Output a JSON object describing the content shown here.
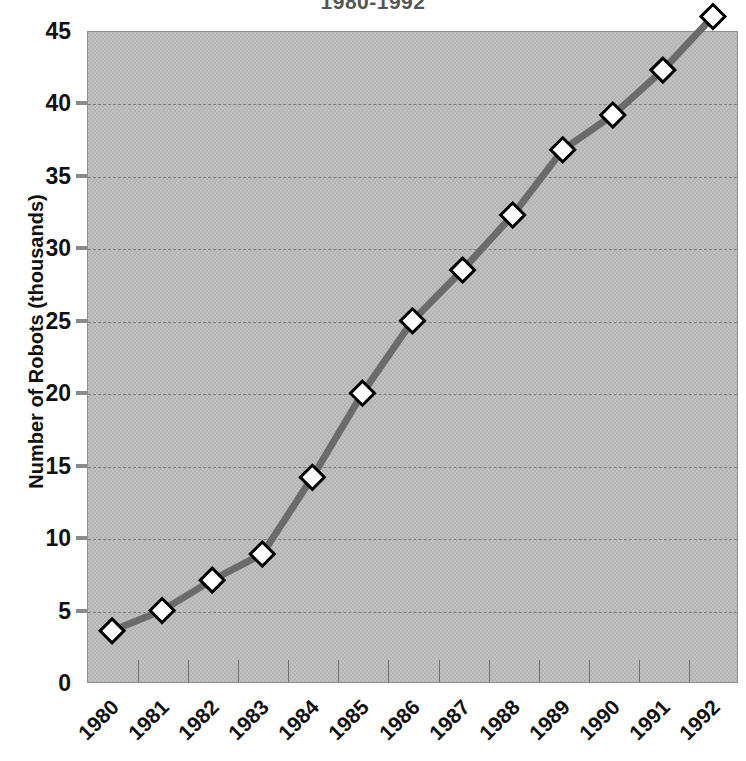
{
  "chart_data": {
    "type": "line",
    "title": "1980-1992",
    "xlabel": "",
    "ylabel": "Number of Robots (thousands)",
    "categories": [
      "1980",
      "1981",
      "1982",
      "1983",
      "1984",
      "1985",
      "1986",
      "1987",
      "1988",
      "1989",
      "1990",
      "1991",
      "1992"
    ],
    "values": [
      3.6,
      5.0,
      7.1,
      8.9,
      14.2,
      20.0,
      25.0,
      28.5,
      32.3,
      36.8,
      39.2,
      42.3,
      46.0
    ],
    "series": [
      {
        "name": "Number of Robots",
        "values": [
          3.6,
          5.0,
          7.1,
          8.9,
          14.2,
          20.0,
          25.0,
          28.5,
          32.3,
          36.8,
          39.2,
          42.3,
          46.0
        ]
      }
    ],
    "ylim": [
      0,
      45
    ],
    "yticks": [
      0,
      5,
      10,
      15,
      20,
      25,
      30,
      35,
      40,
      45
    ],
    "ytick_labels": [
      "0",
      "5",
      "10",
      "15",
      "20",
      "25",
      "30",
      "35",
      "40",
      "45"
    ],
    "xtick_labels": [
      "1980",
      "1981",
      "1982",
      "1983",
      "1984",
      "1985",
      "1986",
      "1987",
      "1988",
      "1989",
      "1990",
      "1991",
      "1992"
    ],
    "xtick_rotation_deg": -45,
    "grid": true,
    "grid_style": "dashed",
    "legend": false,
    "legend_position": "none",
    "marker": "diamond",
    "marker_face_color": "#ffffff",
    "marker_edge_color": "#000000",
    "line_color": "#6b6b6b",
    "line_width": 7,
    "plot_background_color": "#b4b4b4",
    "figure_background_color": "#ffffff",
    "axis_text_color": "#111111",
    "title_color": "#555555",
    "gridline_color": "#7e7e7e"
  }
}
